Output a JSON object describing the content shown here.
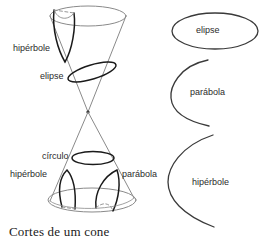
{
  "figure": {
    "caption": "Cortes de um cone",
    "stroke_color": "#3a3a3a",
    "light_stroke_color": "#8a8a8a",
    "text_color": "#2b2b2b",
    "background": "#ffffff"
  },
  "cone_diagram": {
    "name": "double-napped-cone",
    "labels": {
      "hyperbola_top": "hipérbole",
      "ellipse_cut": "elipse",
      "circle_cut": "círculo",
      "hyperbola_bottom": "hipérbole",
      "parabola_bottom": "parábola"
    }
  },
  "sections_column": {
    "items": [
      {
        "name": "ellipse",
        "label": "elipse",
        "shape": "closed-ellipse"
      },
      {
        "name": "parabola",
        "label": "parábola",
        "shape": "open-curve"
      },
      {
        "name": "hyperbola",
        "label": "hipérbole",
        "shape": "open-curve"
      }
    ]
  }
}
